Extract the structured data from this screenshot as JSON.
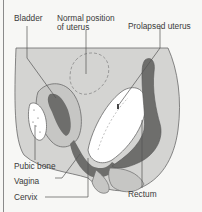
{
  "diagram": {
    "labels": {
      "bladder": "Bladder",
      "normal_position_line1": "Normal position",
      "normal_position_line2": "of uterus",
      "prolapsed_uterus": "Prolapsed uterus",
      "pubic_bone": "Pubic bone",
      "vagina": "Vagina",
      "cervix": "Cervix",
      "rectum": "Rectum"
    },
    "colors": {
      "background": "#f7f7f5",
      "body_fill": "#d4d4d2",
      "organ_wall": "#c6c6c4",
      "dark_tissue": "#6e6e6c",
      "uterus_fill": "#ffffff",
      "outline": "#6a6a6a",
      "dashed_outline": "#8a8a8a",
      "leader_line": "#555555",
      "text": "#3a3a3a"
    }
  }
}
